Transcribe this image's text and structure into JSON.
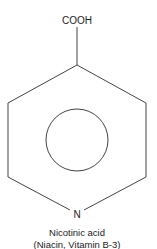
{
  "molecule": {
    "substituent_label": "COOH",
    "ring_atom_label": "N",
    "name": "Nicotinic acid",
    "synonyms": "(Niacin, Vitamin B-3)"
  },
  "colors": {
    "stroke": "#444444",
    "text": "#222222",
    "background": "#ffffff"
  }
}
